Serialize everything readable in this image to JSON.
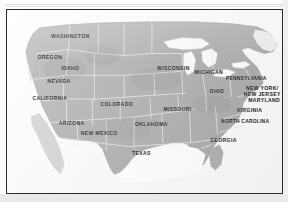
{
  "document": {
    "type": "map-figure",
    "title": "United States Map with State Labels",
    "frame_color": "#2b2b2b",
    "land_color": "#b4b4b4",
    "water_color": "#ffffff",
    "border_color": "#eeeeee",
    "label_color": "#1b1b1b",
    "paper_color": "#fbfbfb"
  },
  "map": {
    "region": "United States",
    "projection_note": "contiguous-48",
    "labels": [
      {
        "name": "WASHINGTON",
        "lines": [
          "WASHINGTON"
        ],
        "x": 23.0,
        "y": 14.6
      },
      {
        "name": "OREGON",
        "lines": [
          "OREGON"
        ],
        "x": 15.6,
        "y": 26.5
      },
      {
        "name": "IDAHO",
        "lines": [
          "IDAHO"
        ],
        "x": 23.0,
        "y": 32.0
      },
      {
        "name": "NEVADA",
        "lines": [
          "NEVADA"
        ],
        "x": 18.9,
        "y": 39.3
      },
      {
        "name": "CALIFORNIA",
        "lines": [
          "CALIFORNIA"
        ],
        "x": 15.6,
        "y": 48.5
      },
      {
        "name": "COLORADO",
        "lines": [
          "COLORADO"
        ],
        "x": 39.9,
        "y": 52.0
      },
      {
        "name": "ARIZONA",
        "lines": [
          "ARIZONA"
        ],
        "x": 23.5,
        "y": 62.5
      },
      {
        "name": "NEW MEXICO",
        "lines": [
          "NEW MEXICO"
        ],
        "x": 33.5,
        "y": 68.0
      },
      {
        "name": "OKLAHOMA",
        "lines": [
          "OKLAHOMA"
        ],
        "x": 52.5,
        "y": 62.8
      },
      {
        "name": "TEXAS",
        "lines": [
          "TEXAS"
        ],
        "x": 48.9,
        "y": 78.9
      },
      {
        "name": "WISCONSIN",
        "lines": [
          "WISCONSIN"
        ],
        "x": 60.5,
        "y": 32.0
      },
      {
        "name": "MICHIGAN",
        "lines": [
          "MICHIGAN"
        ],
        "x": 73.4,
        "y": 34.2
      },
      {
        "name": "OHIO",
        "lines": [
          "OHIO"
        ],
        "x": 76.3,
        "y": 45.0
      },
      {
        "name": "MISSOURI",
        "lines": [
          "MISSOURI"
        ],
        "x": 62.0,
        "y": 54.7
      },
      {
        "name": "PENNSYLVANIA",
        "lines": [
          "PENNSYLVANIA"
        ],
        "x": 87.0,
        "y": 37.8
      },
      {
        "name": "NEW YORK NEW JERSEY",
        "lines": [
          "NEW YORK/",
          "NEW JERSEY"
        ],
        "x": 92.8,
        "y": 44.6
      },
      {
        "name": "MARYLAND",
        "lines": [
          "MARYLAND"
        ],
        "x": 93.5,
        "y": 49.8
      },
      {
        "name": "VIRGINIA",
        "lines": [
          "VIRGINIA"
        ],
        "x": 88.2,
        "y": 55.2
      },
      {
        "name": "NORTH CAROLINA",
        "lines": [
          "NORTH CAROLINA"
        ],
        "x": 86.6,
        "y": 61.3
      },
      {
        "name": "GEORGIA",
        "lines": [
          "GEORGIA"
        ],
        "x": 78.7,
        "y": 71.8
      }
    ]
  }
}
